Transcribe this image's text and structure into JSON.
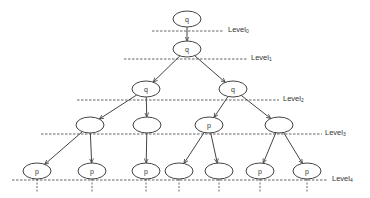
{
  "diagram": {
    "colors": {
      "stroke": "#444444",
      "dash": "#555555",
      "text": "#333333",
      "background": "#ffffff"
    },
    "levels": [
      {
        "label": "Level",
        "sub": "0",
        "y": 31,
        "x1": 152,
        "x2": 224,
        "label_x": 228
      },
      {
        "label": "Level",
        "sub": "1",
        "y": 59,
        "x1": 124,
        "x2": 247,
        "label_x": 251
      },
      {
        "label": "Level",
        "sub": "2",
        "y": 100,
        "x1": 77,
        "x2": 279,
        "label_x": 283
      },
      {
        "label": "Level",
        "sub": "3",
        "y": 134,
        "x1": 41,
        "x2": 322,
        "label_x": 325
      },
      {
        "label": "Level",
        "sub": "4",
        "y": 180,
        "x1": 12,
        "x2": 328,
        "label_x": 332
      }
    ],
    "nodes": [
      {
        "id": "n0",
        "x": 187,
        "y": 19,
        "label": "q"
      },
      {
        "id": "n1",
        "x": 187,
        "y": 49,
        "label": "q"
      },
      {
        "id": "n2",
        "x": 146,
        "y": 89,
        "label": "q"
      },
      {
        "id": "n3",
        "x": 233,
        "y": 89,
        "label": "q"
      },
      {
        "id": "n4",
        "x": 90,
        "y": 125,
        "label": ""
      },
      {
        "id": "n5",
        "x": 147,
        "y": 125,
        "label": ""
      },
      {
        "id": "n6",
        "x": 209,
        "y": 125,
        "label": "p"
      },
      {
        "id": "n7",
        "x": 279,
        "y": 125,
        "label": ""
      },
      {
        "id": "n8",
        "x": 37,
        "y": 171,
        "label": "p"
      },
      {
        "id": "n9",
        "x": 92,
        "y": 171,
        "label": "p"
      },
      {
        "id": "n10",
        "x": 146,
        "y": 171,
        "label": "p"
      },
      {
        "id": "n11",
        "x": 179,
        "y": 171,
        "label": ""
      },
      {
        "id": "n12",
        "x": 219,
        "y": 171,
        "label": ""
      },
      {
        "id": "n13",
        "x": 260,
        "y": 171,
        "label": "p"
      },
      {
        "id": "n14",
        "x": 307,
        "y": 171,
        "label": "p"
      }
    ],
    "edges": [
      [
        "n0",
        "n1"
      ],
      [
        "n1",
        "n2"
      ],
      [
        "n1",
        "n3"
      ],
      [
        "n2",
        "n4"
      ],
      [
        "n2",
        "n5"
      ],
      [
        "n3",
        "n6"
      ],
      [
        "n3",
        "n7"
      ],
      [
        "n4",
        "n8"
      ],
      [
        "n4",
        "n9"
      ],
      [
        "n5",
        "n10"
      ],
      [
        "n6",
        "n11"
      ],
      [
        "n6",
        "n12"
      ],
      [
        "n7",
        "n13"
      ],
      [
        "n7",
        "n14"
      ]
    ],
    "stubs": [
      37,
      92,
      146,
      179,
      219,
      260,
      307
    ],
    "node_rx": 14,
    "node_ry": 8
  }
}
